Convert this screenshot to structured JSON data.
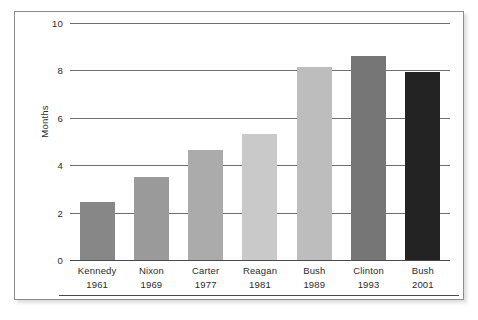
{
  "chart_data": {
    "type": "bar",
    "title": "",
    "xlabel": "",
    "ylabel": "Months",
    "ylim": [
      0,
      10
    ],
    "yticks": [
      0,
      2,
      4,
      6,
      8,
      10
    ],
    "grid": "horizontal",
    "legend": "none",
    "categories": [
      "Kennedy\n1961",
      "Nixon\n1969",
      "Carter\n1977",
      "Reagan\n1981",
      "Bush\n1989",
      "Clinton\n1993",
      "Bush\n2001"
    ],
    "values": [
      2.45,
      3.5,
      4.65,
      5.3,
      8.15,
      8.6,
      7.95
    ],
    "bars": [
      {
        "name": "Kennedy",
        "year": "1961",
        "value": 2.45,
        "color": "#878787"
      },
      {
        "name": "Nixon",
        "year": "1969",
        "value": 3.5,
        "color": "#9a9a9a"
      },
      {
        "name": "Carter",
        "year": "1977",
        "value": 4.65,
        "color": "#ababab"
      },
      {
        "name": "Reagan",
        "year": "1981",
        "value": 5.3,
        "color": "#c9c9c9"
      },
      {
        "name": "Bush",
        "year": "1989",
        "value": 8.15,
        "color": "#bdbdbd"
      },
      {
        "name": "Clinton",
        "year": "1993",
        "value": 8.6,
        "color": "#767676"
      },
      {
        "name": "Bush",
        "year": "2001",
        "value": 7.95,
        "color": "#232323"
      }
    ]
  },
  "axes": {
    "y_title": "Months",
    "y_tick_labels": [
      "10",
      "8",
      "6",
      "4",
      "2",
      "0"
    ]
  },
  "colors": {
    "plot_background": "#ffffff",
    "page_background": "#ffffff",
    "frame_border": "#8c8c8c",
    "gridline": "#6f6f6f",
    "axis_text": "#2b2b2b"
  }
}
